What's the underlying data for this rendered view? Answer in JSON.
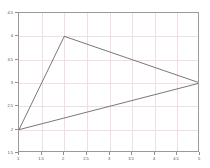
{
  "chart_data": {
    "type": "line",
    "title": "",
    "subtitle": "",
    "xlabel": "",
    "ylabel": "",
    "xlim": [
      1,
      5
    ],
    "ylim": [
      1.5,
      4.5
    ],
    "xticks": [
      1,
      1.5,
      2,
      2.5,
      3,
      3.5,
      4,
      4.5,
      5
    ],
    "xtick_labels": [
      "1",
      "1.5",
      "2",
      "2.5",
      "3",
      "3.5",
      "4",
      "4.5",
      "5"
    ],
    "yticks": [
      1.5,
      2,
      2.5,
      3,
      3.5,
      4,
      4.5
    ],
    "ytick_labels": [
      "1.5",
      "2",
      "2.5",
      "3",
      "3.5",
      "4",
      "4.5"
    ],
    "grid": true,
    "grid_color": "#f2dede",
    "axis_color": "#9a9a9a",
    "background_color": "#ffffff",
    "legend": null,
    "legend_position": "none",
    "annotations": [],
    "series": [
      {
        "name": "triangle",
        "line_color": "#555555",
        "line_width": 0.8,
        "marker": "none",
        "closed": true,
        "points": [
          {
            "x": 1,
            "y": 2
          },
          {
            "x": 2,
            "y": 4
          },
          {
            "x": 5,
            "y": 3
          },
          {
            "x": 1,
            "y": 2
          }
        ],
        "x": [
          1,
          2,
          5,
          1
        ],
        "values": [
          2,
          4,
          3,
          2
        ]
      }
    ]
  }
}
